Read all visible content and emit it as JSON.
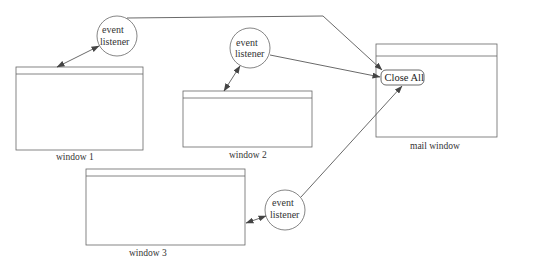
{
  "diagram": {
    "colors": {
      "stroke": "#555555",
      "background": "#ffffff",
      "text": "#333333"
    },
    "windows": [
      {
        "id": "window1",
        "label": "window 1"
      },
      {
        "id": "window2",
        "label": "window 2"
      },
      {
        "id": "window3",
        "label": "window 3"
      },
      {
        "id": "mail",
        "label": "mail window"
      }
    ],
    "mail_window": {
      "button_label": "Close All"
    },
    "listeners": [
      {
        "id": "listener1",
        "line1": "event",
        "line2": "listener"
      },
      {
        "id": "listener2",
        "line1": "event",
        "line2": "listener"
      },
      {
        "id": "listener3",
        "line1": "event",
        "line2": "listener"
      }
    ],
    "edges": [
      {
        "from": "listener1",
        "to": "window1",
        "type": "bidirectional"
      },
      {
        "from": "listener2",
        "to": "window2",
        "type": "bidirectional"
      },
      {
        "from": "listener3",
        "to": "window3",
        "type": "bidirectional"
      },
      {
        "from": "listener1",
        "to": "Close All",
        "type": "arrow"
      },
      {
        "from": "listener2",
        "to": "Close All",
        "type": "arrow"
      },
      {
        "from": "listener3",
        "to": "Close All",
        "type": "arrow"
      }
    ]
  }
}
